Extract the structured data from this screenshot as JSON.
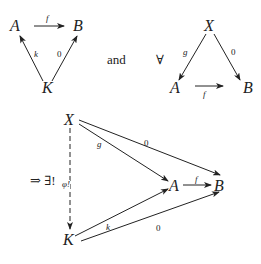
{
  "diagram_type": "commutative-diagram",
  "diagram1": {
    "objects": {
      "A": "A",
      "B": "B",
      "K": "K"
    },
    "morphisms": {
      "f": "f",
      "k": "k",
      "zero": "0"
    }
  },
  "connector": "and",
  "quantifier": "∀",
  "diagram2": {
    "objects": {
      "X": "X",
      "A": "A",
      "B": "B"
    },
    "morphisms": {
      "g": "g",
      "zero": "0",
      "f": "f"
    }
  },
  "implication": "⇒ ∃!",
  "diagram3": {
    "objects": {
      "X": "X",
      "A": "A",
      "B": "B",
      "K": "K"
    },
    "morphisms": {
      "g": "g",
      "zero_top": "0",
      "f": "f",
      "k": "k",
      "zero_bottom": "0",
      "phi": "φ!"
    }
  },
  "colors": {
    "ink": "#222222",
    "background": "#ffffff"
  }
}
